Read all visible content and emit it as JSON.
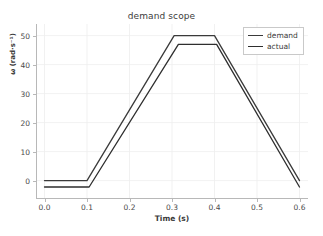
{
  "chart_data": {
    "type": "line",
    "title": "demand scope",
    "xlabel": "Time (s)",
    "ylabel": "ω (rad·s⁻¹)",
    "xlim": [
      -0.02,
      0.62
    ],
    "ylim": [
      -6,
      54
    ],
    "xticks": [
      0.0,
      0.1,
      0.2,
      0.3,
      0.4,
      0.5,
      0.6
    ],
    "xtick_labels": [
      "0.0",
      "0.1",
      "0.2",
      "0.3",
      "0.4",
      "0.5",
      "0.6"
    ],
    "yticks": [
      0,
      10,
      20,
      30,
      40,
      50
    ],
    "ytick_labels": [
      "0",
      "10",
      "20",
      "30",
      "40",
      "50"
    ],
    "grid": true,
    "legend_position": "upper right",
    "series": [
      {
        "name": "demand",
        "color": "#3a3a3a",
        "x": [
          0.0,
          0.1,
          0.305,
          0.4,
          0.6
        ],
        "y": [
          0,
          0,
          50,
          50,
          0
        ]
      },
      {
        "name": "actual",
        "color": "#2e2e2e",
        "x": [
          0.0,
          0.105,
          0.315,
          0.405,
          0.6
        ],
        "y": [
          -2.2,
          -2.2,
          47,
          47,
          -2.2
        ]
      }
    ]
  },
  "legend": {
    "entries": [
      {
        "label": "demand"
      },
      {
        "label": "actual"
      }
    ]
  }
}
